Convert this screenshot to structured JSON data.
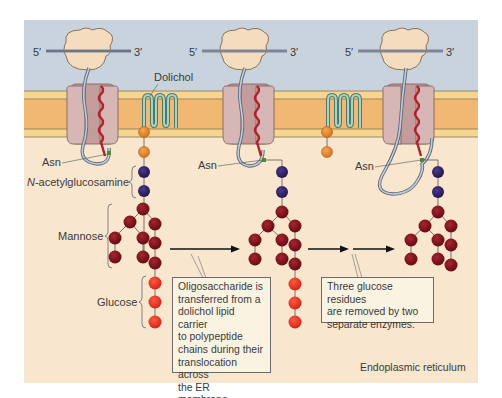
{
  "diagram": {
    "colors": {
      "cytosol": "#c9d3dd",
      "membrane_outer_band": "#f5d690",
      "membrane_core": "#f0b873",
      "membrane_line": "#6b5a40",
      "er_lumen": "#f8e6cf",
      "ribosome": "#f6dcbf",
      "translocon": "#d3afae",
      "translocon_dark": "#b78f8f",
      "mrna": "#7c8597",
      "polypeptide": "#b0bac5",
      "signal_sequence": "#b3202a",
      "dolichol": "#8cbcaa",
      "phosphate": "#e8892e",
      "glcnac": "#2f1f63",
      "mannose": "#7d0f17",
      "glucose": "#e8301f",
      "asn_mark": "#4b8a3a"
    },
    "labels": {
      "five_prime": "5′",
      "three_prime": "3′",
      "dolichol": "Dolichol",
      "asn": "Asn",
      "glcnac": "N-acetylglucosamine",
      "glcnac_italic_prefix": "N",
      "glcnac_rest": "-acetylglucosamine",
      "mannose": "Mannose",
      "glucose": "Glucose",
      "phosphate": "P",
      "compartment": "Endoplasmic reticulum"
    },
    "callouts": [
      {
        "id": "transfer",
        "lines": [
          "Oligosaccharide is",
          "transferred from a",
          "dolichol lipid carrier",
          "to polypeptide",
          "chains during their",
          "translocation across",
          "the ER membrane."
        ]
      },
      {
        "id": "trimming",
        "lines": [
          "Three glucose residues",
          "are removed by two",
          "separate enzymes."
        ]
      }
    ],
    "stages": [
      {
        "name": "stage-1-dolichol-precursor",
        "glcnac": 2,
        "mannose": 9,
        "glucose": 3
      },
      {
        "name": "stage-2-transferred",
        "glcnac": 2,
        "mannose": 9,
        "glucose": 3
      },
      {
        "name": "stage-3-trimmed",
        "glcnac": 2,
        "mannose": 9,
        "glucose": 0
      }
    ]
  }
}
